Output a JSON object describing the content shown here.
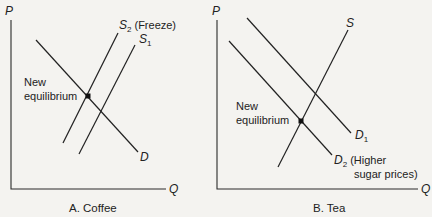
{
  "panels": [
    {
      "id": "A",
      "caption": "A. Coffee",
      "y_axis_label": "P",
      "x_axis_label": "Q",
      "curves": [
        {
          "name": "S2",
          "label_main": "S",
          "label_sub": "2",
          "note": "(Freeze)",
          "type": "supply",
          "from": [
            63,
            143
          ],
          "to": [
            118,
            33
          ]
        },
        {
          "name": "S1",
          "label_main": "S",
          "label_sub": "1",
          "note": "",
          "type": "supply",
          "from": [
            79,
            154
          ],
          "to": [
            135,
            45
          ]
        },
        {
          "name": "D",
          "label_main": "D",
          "label_sub": "",
          "note": "",
          "type": "demand",
          "from": [
            36,
            40
          ],
          "to": [
            138,
            152
          ]
        }
      ],
      "equilibrium_label_line1": "New",
      "equilibrium_label_line2": "equilibrium",
      "equilibrium_point": [
        88,
        96
      ]
    },
    {
      "id": "B",
      "caption": "B. Tea",
      "y_axis_label": "P",
      "x_axis_label": "Q",
      "curves": [
        {
          "name": "S",
          "label_main": "S",
          "label_sub": "",
          "note": "",
          "type": "supply",
          "from": [
            278,
            167
          ],
          "to": [
            348,
            30
          ]
        },
        {
          "name": "D1",
          "label_main": "D",
          "label_sub": "1",
          "note": "",
          "type": "demand",
          "from": [
            247,
            18
          ],
          "to": [
            351,
            133
          ]
        },
        {
          "name": "D2",
          "label_main": "D",
          "label_sub": "2",
          "note_line1": "(Higher",
          "note_line2": "sugar prices)",
          "type": "demand",
          "from": [
            229,
            41
          ],
          "to": [
            332,
            155
          ]
        }
      ],
      "equilibrium_label_line1": "New",
      "equilibrium_label_line2": "equilibrium",
      "equilibrium_point": [
        301,
        121
      ]
    }
  ]
}
